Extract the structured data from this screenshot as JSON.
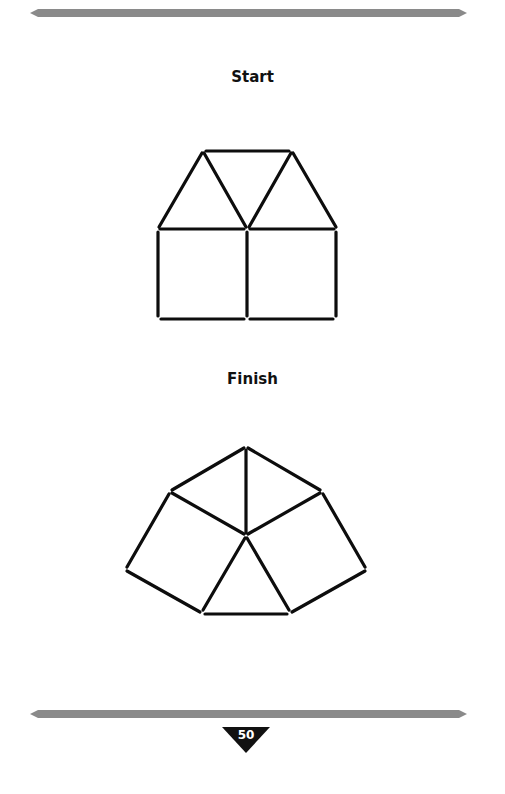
{
  "page": {
    "start_heading": "Start",
    "finish_heading": "Finish",
    "page_number": "50"
  },
  "colors": {
    "rule": "#8a8a8a",
    "stroke": "#0d0d0d",
    "page_badge": "#111111"
  },
  "figures": {
    "start": {
      "description": "House shape: two squares side by side topped by two triangles joined by a top bar",
      "matchsticks": 12
    },
    "finish": {
      "description": "Half-hexagon fan: three triangles and two squares around a central point",
      "matchsticks": 12
    }
  }
}
